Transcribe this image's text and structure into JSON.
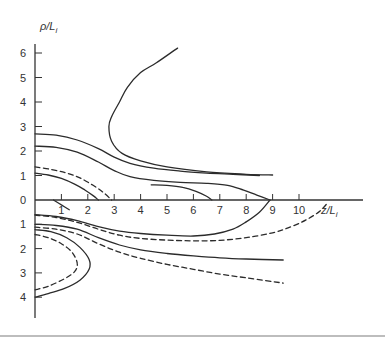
{
  "chart_data": {
    "type": "line",
    "title": "",
    "xlabel": "z/L_i",
    "ylabel": "ρ/L_i",
    "xlim": [
      0,
      12.2
    ],
    "ylim": [
      -4.8,
      6.6
    ],
    "grid": false,
    "legend": null,
    "x_ticks": [
      1,
      2,
      3,
      4,
      5,
      6,
      7,
      8,
      9,
      10
    ],
    "y_ticks_upper": [
      0,
      1,
      2,
      3,
      4,
      5,
      6
    ],
    "y_ticks_lower": [
      1,
      2,
      3,
      4
    ],
    "note": "Contour-style plot: upper half shows rho above axis, lower half shows rho below axis (labels positive downward). Lower-half values stored as negative.",
    "series": [
      {
        "name": "upper-C-curve",
        "style": "solid",
        "points": [
          [
            5.4,
            6.2
          ],
          [
            4.6,
            5.6
          ],
          [
            4.0,
            5.2
          ],
          [
            3.5,
            4.6
          ],
          [
            3.2,
            4.0
          ],
          [
            2.9,
            3.4
          ],
          [
            2.8,
            3.0
          ],
          [
            2.9,
            2.4
          ],
          [
            3.3,
            1.9
          ],
          [
            4.0,
            1.6
          ],
          [
            5.0,
            1.35
          ],
          [
            6.5,
            1.15
          ],
          [
            8.0,
            1.05
          ],
          [
            9.0,
            1.02
          ]
        ]
      },
      {
        "name": "upper-solid-A",
        "style": "solid",
        "points": [
          [
            0,
            2.7
          ],
          [
            0.8,
            2.65
          ],
          [
            1.6,
            2.45
          ],
          [
            2.4,
            2.1
          ],
          [
            3.0,
            1.75
          ],
          [
            3.6,
            1.5
          ],
          [
            4.5,
            1.3
          ],
          [
            5.5,
            1.18
          ],
          [
            6.5,
            1.1
          ],
          [
            7.5,
            1.05
          ],
          [
            8.5,
            1.0
          ]
        ]
      },
      {
        "name": "upper-solid-B",
        "style": "solid",
        "points": [
          [
            0,
            2.2
          ],
          [
            0.8,
            2.15
          ],
          [
            1.6,
            1.95
          ],
          [
            2.4,
            1.55
          ],
          [
            3.0,
            1.2
          ],
          [
            3.6,
            0.95
          ],
          [
            4.5,
            0.8
          ],
          [
            5.5,
            0.72
          ],
          [
            6.5,
            0.68
          ],
          [
            7.3,
            0.6
          ],
          [
            7.9,
            0.4
          ],
          [
            8.4,
            0.2
          ],
          [
            8.9,
            0
          ]
        ]
      },
      {
        "name": "upper-dashed",
        "style": "dashed",
        "points": [
          [
            0,
            1.35
          ],
          [
            0.6,
            1.25
          ],
          [
            1.2,
            1.1
          ],
          [
            1.7,
            0.9
          ],
          [
            2.2,
            0.6
          ],
          [
            2.6,
            0.3
          ],
          [
            2.9,
            0
          ]
        ]
      },
      {
        "name": "upper-solid-C",
        "style": "solid",
        "points": [
          [
            0,
            1.1
          ],
          [
            0.5,
            1.02
          ],
          [
            1.0,
            0.88
          ],
          [
            1.5,
            0.65
          ],
          [
            1.9,
            0.4
          ],
          [
            2.2,
            0.18
          ],
          [
            2.4,
            0
          ]
        ]
      },
      {
        "name": "upper-solid-D",
        "style": "solid",
        "points": [
          [
            4.4,
            0.62
          ],
          [
            5.0,
            0.6
          ],
          [
            5.6,
            0.52
          ],
          [
            6.1,
            0.35
          ],
          [
            6.5,
            0.15
          ],
          [
            6.7,
            0
          ]
        ]
      },
      {
        "name": "lower-short-segment",
        "style": "solid",
        "points": [
          [
            0.7,
            0
          ],
          [
            1.0,
            -0.2
          ],
          [
            1.3,
            -0.4
          ]
        ]
      },
      {
        "name": "lower-solid-E",
        "style": "solid",
        "points": [
          [
            0,
            -0.6
          ],
          [
            0.8,
            -0.68
          ],
          [
            1.6,
            -0.85
          ],
          [
            2.4,
            -1.1
          ],
          [
            3.2,
            -1.28
          ],
          [
            4.0,
            -1.38
          ],
          [
            5.0,
            -1.45
          ],
          [
            6.0,
            -1.48
          ],
          [
            6.8,
            -1.4
          ],
          [
            7.5,
            -1.2
          ],
          [
            8.0,
            -0.9
          ],
          [
            8.5,
            -0.5
          ],
          [
            8.9,
            0
          ]
        ]
      },
      {
        "name": "lower-dashed-F",
        "style": "dashed",
        "points": [
          [
            0,
            -0.62
          ],
          [
            0.8,
            -0.72
          ],
          [
            1.6,
            -0.92
          ],
          [
            2.4,
            -1.2
          ],
          [
            3.2,
            -1.45
          ],
          [
            4.0,
            -1.58
          ],
          [
            5.0,
            -1.65
          ],
          [
            6.0,
            -1.68
          ],
          [
            7.0,
            -1.66
          ],
          [
            8.0,
            -1.55
          ],
          [
            9.0,
            -1.35
          ],
          [
            9.7,
            -1.1
          ],
          [
            10.3,
            -0.8
          ],
          [
            10.8,
            -0.45
          ],
          [
            11.1,
            -0.1
          ]
        ]
      },
      {
        "name": "lower-solid-G",
        "style": "solid",
        "points": [
          [
            0,
            -1.0
          ],
          [
            0.8,
            -1.05
          ],
          [
            1.6,
            -1.2
          ],
          [
            2.4,
            -1.55
          ],
          [
            3.2,
            -1.85
          ],
          [
            4.0,
            -2.05
          ],
          [
            5.0,
            -2.2
          ],
          [
            6.0,
            -2.3
          ],
          [
            7.0,
            -2.38
          ],
          [
            8.0,
            -2.43
          ],
          [
            9.4,
            -2.47
          ]
        ]
      },
      {
        "name": "lower-dashed-H",
        "style": "dashed",
        "points": [
          [
            0,
            -1.12
          ],
          [
            0.8,
            -1.2
          ],
          [
            1.6,
            -1.4
          ],
          [
            2.4,
            -1.8
          ],
          [
            3.2,
            -2.15
          ],
          [
            4.0,
            -2.4
          ],
          [
            5.0,
            -2.65
          ],
          [
            6.0,
            -2.85
          ],
          [
            7.0,
            -3.05
          ],
          [
            8.0,
            -3.2
          ],
          [
            9.4,
            -3.42
          ]
        ]
      },
      {
        "name": "lower-solid-loop",
        "style": "solid",
        "points": [
          [
            0,
            -1.22
          ],
          [
            0.6,
            -1.3
          ],
          [
            1.2,
            -1.55
          ],
          [
            1.7,
            -1.95
          ],
          [
            2.05,
            -2.45
          ],
          [
            2.05,
            -2.85
          ],
          [
            1.7,
            -3.3
          ],
          [
            1.1,
            -3.65
          ],
          [
            0.5,
            -3.85
          ],
          [
            0,
            -4.0
          ]
        ]
      },
      {
        "name": "lower-dashed-loop",
        "style": "dashed",
        "points": [
          [
            0,
            -1.42
          ],
          [
            0.5,
            -1.55
          ],
          [
            1.0,
            -1.8
          ],
          [
            1.4,
            -2.15
          ],
          [
            1.6,
            -2.6
          ],
          [
            1.5,
            -2.95
          ],
          [
            1.1,
            -3.25
          ],
          [
            0.5,
            -3.55
          ],
          [
            0,
            -3.7
          ]
        ]
      }
    ]
  },
  "axes": {
    "x_label_main": "z/L",
    "x_label_sub": "i",
    "y_label_main": "ρ/L",
    "y_label_sub": "i"
  }
}
